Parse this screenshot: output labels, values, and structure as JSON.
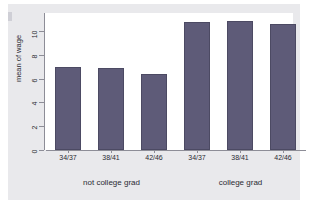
{
  "chart_data": {
    "type": "bar",
    "title": "",
    "subtitle": "",
    "xlabel": "",
    "ylabel": "mean of wage",
    "ylim": [
      0,
      11.5
    ],
    "yticks": [
      0,
      2,
      4,
      6,
      8,
      10
    ],
    "ytick_labels": [
      "0",
      "2",
      "4",
      "6",
      "8",
      "10"
    ],
    "grid": false,
    "legend": null,
    "bar_color": "#5e5b78",
    "panel_color": "#ffffff",
    "figure_color": "#e9e9ec",
    "axis_color": "#8d8d97",
    "groups": [
      {
        "label": "not college grad",
        "categories": [
          "34/37",
          "38/41",
          "42/46"
        ],
        "values": [
          7.0,
          6.85,
          6.4
        ]
      },
      {
        "label": "college grad",
        "categories": [
          "34/37",
          "38/41",
          "42/46"
        ],
        "values": [
          10.75,
          10.8,
          10.55
        ]
      }
    ],
    "categories": [
      "34/37",
      "38/41",
      "42/46",
      "34/37",
      "38/41",
      "42/46"
    ],
    "values": [
      7.0,
      6.85,
      6.4,
      10.75,
      10.8,
      10.55
    ]
  }
}
